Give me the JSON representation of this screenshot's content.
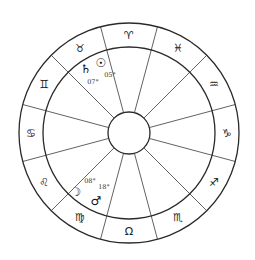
{
  "chart": {
    "center": [
      129,
      133
    ],
    "outer_radius": 110,
    "inner_radius": 86,
    "hub_radius": 21,
    "spoke_start_angle_deg": 15,
    "colors": {
      "line": "#2a2a2a",
      "text": "#222222",
      "background": "#ffffff"
    }
  },
  "signs": [
    {
      "name": "Aries",
      "glyph": "♈︎",
      "angle": 90
    },
    {
      "name": "Pisces",
      "glyph": "♓︎",
      "angle": 60
    },
    {
      "name": "Aquarius",
      "glyph": "♒︎",
      "angle": 30
    },
    {
      "name": "Capricorn",
      "glyph": "♑︎",
      "angle": 0
    },
    {
      "name": "Sagittarius",
      "glyph": "♐︎",
      "angle": -30
    },
    {
      "name": "Scorpio",
      "glyph": "♏︎",
      "angle": -60
    },
    {
      "name": "Libra",
      "glyph": "Ω",
      "angle": -90
    },
    {
      "name": "Virgo",
      "glyph": "♍︎",
      "angle": -120
    },
    {
      "name": "Leo",
      "glyph": "♌︎",
      "angle": -150
    },
    {
      "name": "Cancer",
      "glyph": "♋︎",
      "angle": 180
    },
    {
      "name": "Gemini",
      "glyph": "♊︎",
      "angle": 150
    },
    {
      "name": "Taurus",
      "glyph": "♉︎",
      "angle": 120
    }
  ],
  "planets": [
    {
      "name": "Saturn",
      "glyph": "♄",
      "x": 86,
      "y": 69,
      "degree": "07°",
      "deg_x": 93,
      "deg_y": 82
    },
    {
      "name": "Sun",
      "glyph": "☉",
      "x": 101,
      "y": 63,
      "degree": "05°",
      "deg_x": 110,
      "deg_y": 75
    },
    {
      "name": "Moon",
      "glyph": "☽",
      "x": 76,
      "y": 192,
      "degree": "08°",
      "deg_x": 90,
      "deg_y": 181
    },
    {
      "name": "Mars",
      "glyph": "♂",
      "x": 96,
      "y": 201,
      "degree": "18°",
      "deg_x": 104,
      "deg_y": 187
    }
  ]
}
